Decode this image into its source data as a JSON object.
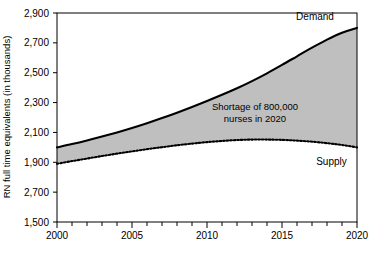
{
  "chart_data": {
    "type": "area",
    "title": "",
    "subtitle": "",
    "xlabel": "",
    "ylabel": "RN full time equivalents (in thousands)",
    "xlim": [
      2000,
      2020
    ],
    "ylim": [
      1500,
      2900
    ],
    "grid": false,
    "legend_position": "inline-annotations",
    "x_tick_labels": [
      "2000",
      "2005",
      "2010",
      "2015",
      "2020"
    ],
    "x_tick_values": [
      2000,
      2005,
      2010,
      2015,
      2020
    ],
    "x_minor_tick_interval": 1,
    "y_tick_labels": [
      "2,900",
      "2,700",
      "2,500",
      "2,300",
      "2,100",
      "1,900",
      "2,700",
      "1,500"
    ],
    "y_tick_values": [
      2900,
      2700,
      2500,
      2300,
      2100,
      1900,
      1700,
      1500
    ],
    "x": [
      2000,
      2001,
      2002,
      2003,
      2004,
      2005,
      2006,
      2007,
      2008,
      2009,
      2010,
      2011,
      2012,
      2013,
      2014,
      2015,
      2016,
      2017,
      2018,
      2019,
      2020
    ],
    "series": [
      {
        "name": "Demand",
        "style": "solid",
        "color": "#000000",
        "values": [
          2000,
          2022,
          2046,
          2072,
          2100,
          2130,
          2162,
          2196,
          2232,
          2270,
          2310,
          2352,
          2396,
          2444,
          2496,
          2552,
          2610,
          2668,
          2722,
          2768,
          2800
        ]
      },
      {
        "name": "Supply",
        "style": "dotted",
        "color": "#000000",
        "values": [
          1890,
          1908,
          1925,
          1942,
          1958,
          1973,
          1988,
          2001,
          2014,
          2025,
          2035,
          2043,
          2049,
          2052,
          2052,
          2050,
          2045,
          2038,
          2028,
          2016,
          2000
        ]
      }
    ],
    "fill_between": {
      "label": "Shortage of 800,000 nurses in 2020",
      "color": "#bfbfbf",
      "between": [
        "Demand",
        "Supply"
      ]
    },
    "annotations": [
      {
        "name": "shortage-note",
        "text_line_1": "Shortage of 800,000",
        "text_line_2": "nurses in 2020",
        "x": 2013.2,
        "y": 2250
      },
      {
        "name": "demand-label",
        "text": "Demand",
        "x": 2017.2,
        "y": 2855
      },
      {
        "name": "supply-label",
        "text": "Supply",
        "x": 2018.3,
        "y": 1885
      }
    ]
  },
  "axes": {
    "y_title": "RN full time equivalents (in thousands)"
  }
}
